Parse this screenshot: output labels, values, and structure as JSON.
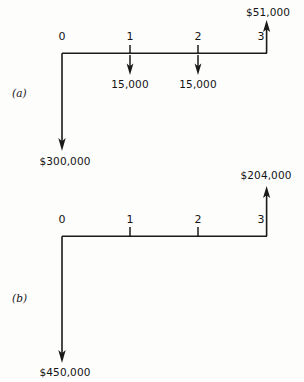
{
  "figure": {
    "type": "cash-flow-diagram-pair",
    "background_color": "#fdfdfc",
    "line_color": "#1a1a1a",
    "panels": [
      {
        "id": "a",
        "panel_label": "(a)",
        "timeline": {
          "tick_labels": [
            "0",
            "1",
            "2",
            "3"
          ],
          "tick_positions_x": [
            62,
            130,
            198,
            267
          ],
          "axis_y": 53
        },
        "cash_flows": [
          {
            "period": "0",
            "direction": "down",
            "label": "$300,000",
            "arrow_from_y": 53,
            "arrow_to_y": 150,
            "x": 62,
            "label_x": 65,
            "label_y": 155
          },
          {
            "period": "1",
            "direction": "down",
            "label": "15,000",
            "arrow_from_y": 53,
            "arrow_to_y": 75,
            "x": 130,
            "label_x": 130,
            "label_y": 79
          },
          {
            "period": "2",
            "direction": "down",
            "label": "15,000",
            "arrow_from_y": 53,
            "arrow_to_y": 75,
            "x": 198,
            "label_x": 198,
            "label_y": 79
          },
          {
            "period": "3",
            "direction": "up",
            "label": "$51,000",
            "arrow_from_y": 53,
            "arrow_to_y": 20,
            "x": 267,
            "label_x": 268,
            "label_y": 7
          }
        ]
      },
      {
        "id": "b",
        "panel_label": "(b)",
        "timeline": {
          "tick_labels": [
            "0",
            "1",
            "2",
            "3"
          ],
          "tick_positions_x": [
            62,
            130,
            198,
            267
          ],
          "axis_y": 236
        },
        "cash_flows": [
          {
            "period": "0",
            "direction": "down",
            "label": "$450,000",
            "arrow_from_y": 236,
            "arrow_to_y": 362,
            "x": 62,
            "label_x": 65,
            "label_y": 366
          },
          {
            "period": "3",
            "direction": "up",
            "label": "$204,000",
            "arrow_from_y": 236,
            "arrow_to_y": 186,
            "x": 267,
            "label_x": 266,
            "label_y": 170
          }
        ]
      }
    ]
  }
}
